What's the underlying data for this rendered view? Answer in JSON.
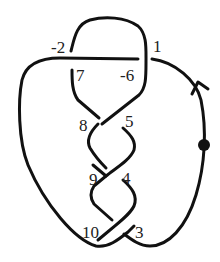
{
  "diagram": {
    "type": "knot-diagram",
    "crossing_labels": [
      "-2",
      "1",
      "7",
      "-6",
      "8",
      "5",
      "9",
      "4",
      "10",
      "3"
    ],
    "markers": {
      "orientation_arrow": "arrow-up-on-right-strand",
      "basepoint": "dot-on-right-strand"
    },
    "colors": {
      "stroke": "#111111",
      "label": "#222222",
      "background": "#ffffff"
    }
  }
}
